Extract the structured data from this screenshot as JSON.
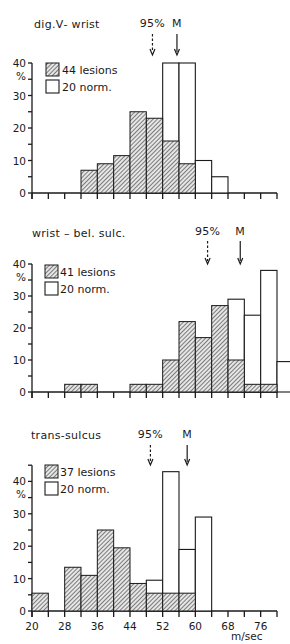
{
  "figure": {
    "x_unit_label": "m/sec",
    "y_unit_label": "%",
    "colors": {
      "ink": "#1a1a1a",
      "background": "#ffffff"
    }
  },
  "chart_data": [
    {
      "type": "bar",
      "title": "dig.Ⅴ- wrist",
      "xlabel": "",
      "ylabel": "%",
      "bin_edges_start": 20,
      "bin_width": 4,
      "xlim": [
        20,
        80
      ],
      "ylim": [
        0,
        40
      ],
      "yticks": [
        0,
        10,
        20,
        30,
        40
      ],
      "ytick_minor_step": 5,
      "show_xtick_labels": false,
      "xtick_labels": [],
      "legend_position": "top-left",
      "annotations": [
        {
          "label": "95%",
          "x": 49.5,
          "style": "dashed-arrow"
        },
        {
          "label": "M",
          "x": 55.5,
          "style": "solid-arrow"
        }
      ],
      "series": [
        {
          "name": "44 lesions",
          "pattern": "hatched",
          "bins": [
            [
              32,
              7
            ],
            [
              36,
              9
            ],
            [
              40,
              11.5
            ],
            [
              44,
              25
            ],
            [
              48,
              23
            ],
            [
              52,
              16
            ],
            [
              56,
              9
            ]
          ]
        },
        {
          "name": "20 norm.",
          "pattern": "open",
          "bins": [
            [
              48,
              5
            ],
            [
              52,
              40
            ],
            [
              56,
              40
            ],
            [
              60,
              10
            ],
            [
              64,
              5
            ]
          ]
        }
      ]
    },
    {
      "type": "bar",
      "title": "wrist – bel. sulc.",
      "xlabel": "",
      "ylabel": "%",
      "bin_edges_start": 20,
      "bin_width": 4,
      "xlim": [
        20,
        80
      ],
      "ylim": [
        0,
        40
      ],
      "yticks": [
        0,
        10,
        20,
        30,
        40
      ],
      "ytick_minor_step": 5,
      "show_xtick_labels": false,
      "xtick_labels": [],
      "legend_position": "top-left",
      "annotations": [
        {
          "label": "95%",
          "x": 63,
          "style": "dashed-arrow"
        },
        {
          "label": "M",
          "x": 71,
          "style": "solid-arrow"
        }
      ],
      "series": [
        {
          "name": "41 lesions",
          "pattern": "hatched",
          "bins": [
            [
              28,
              2.4
            ],
            [
              32,
              2.4
            ],
            [
              44,
              2.4
            ],
            [
              48,
              2.4
            ],
            [
              52,
              10
            ],
            [
              56,
              22
            ],
            [
              60,
              17
            ],
            [
              64,
              27
            ],
            [
              68,
              10
            ],
            [
              72,
              2.4
            ],
            [
              76,
              2.4
            ]
          ]
        },
        {
          "name": "20 norm.",
          "pattern": "open",
          "bins": [
            [
              68,
              29
            ],
            [
              72,
              24
            ],
            [
              76,
              38
            ],
            [
              80,
              9.5
            ]
          ]
        }
      ]
    },
    {
      "type": "bar",
      "title": "trans-sulcus",
      "xlabel": "m/sec",
      "ylabel": "%",
      "bin_edges_start": 20,
      "bin_width": 4,
      "xlim": [
        20,
        80
      ],
      "ylim": [
        0,
        45
      ],
      "yticks": [
        0,
        10,
        20,
        30,
        40
      ],
      "ytick_minor_step": 5,
      "show_xtick_labels": true,
      "xtick_labels": [
        "20",
        "28",
        "36",
        "44",
        "52",
        "60",
        "68",
        "76"
      ],
      "legend_position": "top-left",
      "annotations": [
        {
          "label": "95%",
          "x": 49,
          "style": "dashed-arrow"
        },
        {
          "label": "M",
          "x": 58,
          "style": "solid-arrow"
        }
      ],
      "series": [
        {
          "name": "37 lesions",
          "pattern": "hatched",
          "bins": [
            [
              20,
              5.5
            ],
            [
              28,
              13.5
            ],
            [
              32,
              11
            ],
            [
              36,
              25
            ],
            [
              40,
              19.5
            ],
            [
              44,
              8.5
            ],
            [
              48,
              5.5
            ],
            [
              52,
              5.5
            ],
            [
              56,
              5.5
            ]
          ]
        },
        {
          "name": "20 norm.",
          "pattern": "open",
          "bins": [
            [
              48,
              9.5
            ],
            [
              52,
              43
            ],
            [
              56,
              19
            ],
            [
              60,
              29
            ]
          ]
        }
      ]
    }
  ]
}
